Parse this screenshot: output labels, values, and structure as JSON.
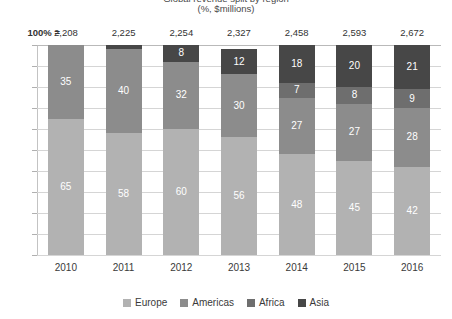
{
  "title_clipped": "Global revenue split by region",
  "subtitle": "(%, $millions)",
  "totals_label": "100% =",
  "legend_position": "bottom",
  "colors": {
    "europe": "#b2b2b2",
    "americas": "#8c8c8c",
    "africa": "#6e6e6e",
    "asia": "#474747",
    "gridline": "#d5d5d5",
    "axis": "#b9b9b9",
    "text": "#3a3a3a",
    "label_text": "#ffffff"
  },
  "chart_data": {
    "type": "bar",
    "subtype": "stacked-100-percent",
    "title": "Global revenue split by region",
    "subtitle": "(%, $millions)",
    "xlabel": "",
    "ylabel": "",
    "ylim": [
      0,
      100
    ],
    "grid": true,
    "grid_interval": 10,
    "legend_position": "bottom",
    "categories": [
      "2010",
      "2011",
      "2012",
      "2013",
      "2014",
      "2015",
      "2016"
    ],
    "totals_label": "100% =",
    "totals": [
      "2,208",
      "2,225",
      "2,254",
      "2,327",
      "2,458",
      "2,593",
      "2,672"
    ],
    "series": [
      {
        "name": "Europe",
        "color": "#b2b2b2",
        "values": [
          65,
          58,
          60,
          56,
          48,
          45,
          42
        ],
        "labels": [
          "65",
          "58",
          "60",
          "56",
          "48",
          "45",
          "42"
        ]
      },
      {
        "name": "Americas",
        "color": "#8c8c8c",
        "values": [
          35,
          40,
          32,
          30,
          27,
          27,
          28
        ],
        "labels": [
          "35",
          "40",
          "32",
          "30",
          "27",
          "27",
          "28"
        ]
      },
      {
        "name": "Africa",
        "color": "#6e6e6e",
        "values": [
          0,
          0,
          0,
          0,
          7,
          8,
          9
        ],
        "labels": [
          "",
          "",
          "",
          "",
          "7",
          "8",
          "9"
        ]
      },
      {
        "name": "Asia",
        "color": "#474747",
        "values": [
          0,
          2,
          8,
          12,
          18,
          20,
          21
        ],
        "labels": [
          "",
          "",
          "8",
          "12",
          "18",
          "20",
          "21"
        ]
      }
    ]
  }
}
